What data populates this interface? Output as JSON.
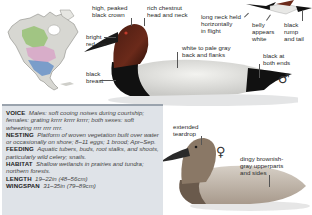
{
  "male_labels": {
    "crown": "high, peaked\nblack crown",
    "head_neck": "rich chestnut\nhead and neck",
    "eye": "bright\nred eye",
    "breast": "black\nbreast",
    "back": "white to pale gray\nback and flanks",
    "ends": "black at\nboth ends",
    "sex_symbol": "♂"
  },
  "flight_labels": {
    "neck": "long neck held\nhorizontally\nin flight",
    "belly": "belly\nappears\nwhite",
    "rump": "black\nrump\nand tail"
  },
  "female_labels": {
    "teardrop": "extended\nteardrop",
    "upperparts": "dingy brownish-\ngray upperparts\nand sides",
    "sex_symbol": "♀"
  },
  "info": [
    {
      "key": "VOICE",
      "value": "Males: soft cooing noises during courtship; females: grating krrrr krrrr krrrr; both sexes: soft wheezing rrrr rrrr rrrr."
    },
    {
      "key": "NESTING",
      "value": "Platform of woven vegetation built over water or occasionally on shore; 8–11 eggs; 1 brood; Apr–Sep."
    },
    {
      "key": "FEEDING",
      "value": "Aquatic tubers, buds, root stalks, and shoots, particularly wild celery; snails."
    },
    {
      "key": "HABITAT",
      "value": "Shallow wetlands in prairies and tundra; northern forests."
    },
    {
      "key": "LENGTH",
      "value": "19–22in (48–56cm)"
    },
    {
      "key": "WINGSPAN",
      "value": "31–35in (79–89cm)"
    }
  ],
  "colors": {
    "chestnut": "#6b2a1a",
    "black": "#111111",
    "back_white": "#e9e9e6",
    "female_body": "#b8a99a",
    "female_head": "#8a7866",
    "infobox_bg": "#dfe3e8",
    "map_breeding": "#9bc37a",
    "map_winter": "#6a93c9",
    "map_migration": "#d8a9c8"
  }
}
